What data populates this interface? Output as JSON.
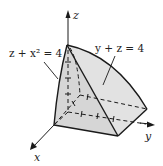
{
  "figure": {
    "axes": {
      "x": "x",
      "y": "y",
      "z": "z"
    },
    "labels": {
      "surface_left": "z + x² = 4",
      "surface_right": "y + z = 4"
    },
    "colors": {
      "fill": "#d8d8d8",
      "stroke": "#1a1a1a"
    }
  }
}
